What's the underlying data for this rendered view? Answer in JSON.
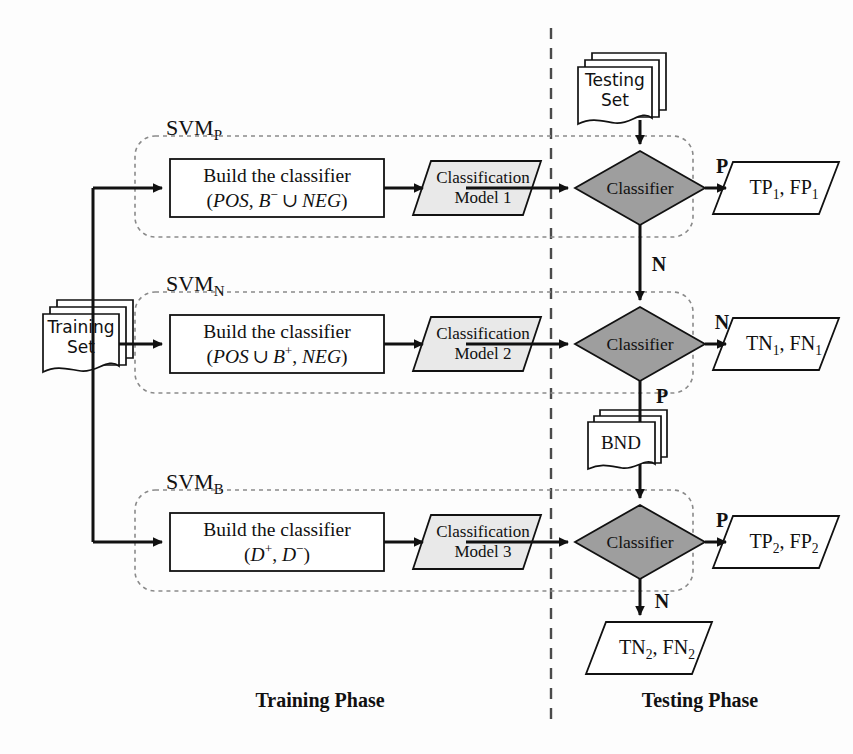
{
  "diagram": {
    "phases": [
      {
        "id": "training",
        "label": "Training Phase"
      },
      {
        "id": "testing",
        "label": "Testing Phase"
      }
    ],
    "data_sources": [
      {
        "id": "training-set",
        "label_line1": "Training",
        "label_line2": "Set"
      },
      {
        "id": "testing-set",
        "label_line1": "Testing",
        "label_line2": "Set"
      },
      {
        "id": "bnd",
        "label_line1": "BND",
        "label_line2": ""
      }
    ],
    "groups": [
      {
        "id": "svm-p",
        "name": "SVM",
        "subscript": "P"
      },
      {
        "id": "svm-n",
        "name": "SVM",
        "subscript": "N"
      },
      {
        "id": "svm-b",
        "name": "SVM",
        "subscript": "B"
      }
    ],
    "build_blocks": [
      {
        "id": "build-1",
        "line1": "Build the classifier",
        "line2_html": "(<i>POS</i>, <i>B</i><sup>&minus;</sup>&thinsp;&cup;&thinsp;<i>NEG</i>)"
      },
      {
        "id": "build-2",
        "line1": "Build the classifier",
        "line2_html": "(<i>POS</i>&thinsp;&cup;&thinsp;<i>B</i><sup>+</sup>, <i>NEG</i>)"
      },
      {
        "id": "build-3",
        "line1": "Build the classifier",
        "line2_html": "(<i>D</i><sup>+</sup>, <i>D</i><sup>&minus;</sup>)"
      }
    ],
    "models": [
      {
        "id": "model-1",
        "line1": "Classification",
        "line2": "Model 1"
      },
      {
        "id": "model-2",
        "line1": "Classification",
        "line2": "Model 2"
      },
      {
        "id": "model-3",
        "line1": "Classification",
        "line2": "Model 3"
      }
    ],
    "decisions": [
      {
        "id": "classifier-1",
        "label": "Classifier"
      },
      {
        "id": "classifier-2",
        "label": "Classifier"
      },
      {
        "id": "classifier-3",
        "label": "Classifier"
      }
    ],
    "outputs": [
      {
        "id": "out-tp1-fp1",
        "html": "TP<sub>1</sub>, FP<sub>1</sub>"
      },
      {
        "id": "out-tn1-fn1",
        "html": "TN<sub>1</sub>, FN<sub>1</sub>"
      },
      {
        "id": "out-tp2-fp2",
        "html": "TP<sub>2</sub>, FP<sub>2</sub>"
      },
      {
        "id": "out-tn2-fn2",
        "html": "TN<sub>2</sub>, FN<sub>2</sub>"
      }
    ],
    "branch_labels": [
      {
        "id": "branch-p-1",
        "label": "P"
      },
      {
        "id": "branch-n-1",
        "label": "N"
      },
      {
        "id": "branch-n-2",
        "label": "N"
      },
      {
        "id": "branch-p-2",
        "label": "P"
      },
      {
        "id": "branch-p-3",
        "label": "P"
      },
      {
        "id": "branch-n-3",
        "label": "N"
      }
    ],
    "colors": {
      "ink": "#111111",
      "decision_fill": "#9e9e9e",
      "model_fill": "#e9e9e9",
      "node_fill": "#ffffff",
      "group_stroke": "#7a7a7a",
      "divider_stroke": "#4a4a4a",
      "background": "#fdfdfd"
    }
  }
}
